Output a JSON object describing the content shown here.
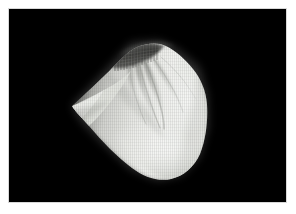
{
  "figure": {
    "kind": "surface-render",
    "background_color": "#000000",
    "page_color": "#ffffff",
    "margin_px": 9,
    "canvas": {
      "x": 9,
      "y": 9,
      "width": 277,
      "height": 193
    }
  },
  "render": {
    "object_name": "shaded-mesh-surface",
    "shading": "diffuse-lambert",
    "wireframe_overlay": true,
    "light_direction": "upper-right",
    "highlight_color": "#f4f5f3",
    "midtone_color": "#c8cac6",
    "shadow_color": "#3a3a3a",
    "void_color": "#000000",
    "features": [
      {
        "name": "left-cusp",
        "x": 72,
        "y": 106,
        "label": "sharp left cusp"
      },
      {
        "name": "upper-ridge",
        "x": 128,
        "y": 46,
        "label": "striated upper ridge"
      },
      {
        "name": "crease-fan",
        "x": 150,
        "y": 80,
        "label": "radiating crease fan"
      },
      {
        "name": "right-bulge",
        "x": 196,
        "y": 98,
        "label": "smooth right bulge"
      },
      {
        "name": "lower-lobe",
        "x": 168,
        "y": 160,
        "label": "rounded lower lobe"
      }
    ],
    "bounds": {
      "left": 68,
      "top": 40,
      "right": 212,
      "bottom": 180
    }
  },
  "annotations": {
    "axis_labels": [],
    "tick_labels": [],
    "legend_entries": [],
    "caption": ""
  }
}
